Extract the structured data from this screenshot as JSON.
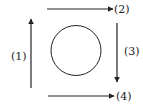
{
  "diagram": {
    "colors": {
      "stroke": "#222222",
      "background": "#ffffff"
    },
    "circle": {
      "cx": 76,
      "cy": 50.5,
      "r": 25
    },
    "arrows": [
      {
        "id": "1",
        "label": "(1)",
        "direction": "up",
        "x1": 31,
        "y1": 88,
        "x2": 31,
        "y2": 19
      },
      {
        "id": "2",
        "label": "(2)",
        "direction": "right",
        "x1": 47,
        "y1": 9,
        "x2": 113,
        "y2": 9
      },
      {
        "id": "3",
        "label": "(3)",
        "direction": "down",
        "x1": 117,
        "y1": 23,
        "x2": 117,
        "y2": 82
      },
      {
        "id": "4",
        "label": "(4)",
        "direction": "right",
        "x1": 48,
        "y1": 96,
        "x2": 114,
        "y2": 96
      }
    ]
  }
}
